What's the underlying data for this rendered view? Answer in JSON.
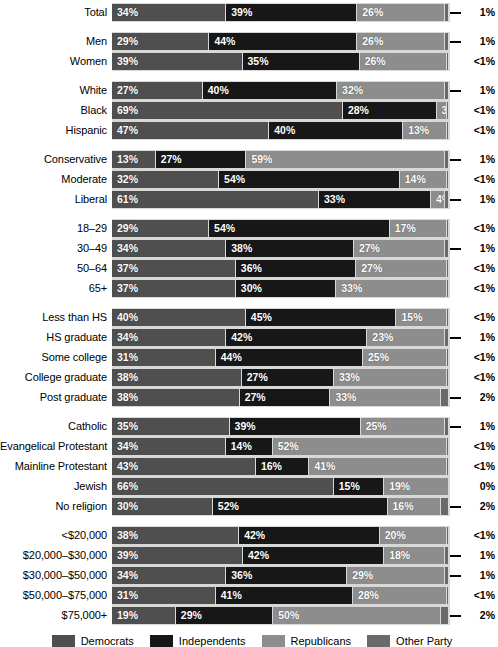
{
  "chart_data": {
    "type": "bar",
    "subtype": "stacked-horizontal-100pct",
    "title": "",
    "xlabel": "",
    "ylabel": "",
    "xlim": [
      0,
      100
    ],
    "grid": false,
    "legend_position": "bottom",
    "series": [
      {
        "name": "Democrats",
        "key": "dem",
        "color": "#4f4f4f"
      },
      {
        "name": "Independents",
        "key": "ind",
        "color": "#171717"
      },
      {
        "name": "Republicans",
        "key": "rep",
        "color": "#8d8d8d"
      },
      {
        "name": "Other Party",
        "key": "oth",
        "color": "#6a6a6a"
      }
    ],
    "groups": [
      {
        "name": "overall",
        "rows": [
          {
            "label": "Total",
            "dem": 34,
            "ind": 39,
            "rep": 26,
            "oth": 1,
            "dem_label": "34%",
            "ind_label": "39%",
            "rep_label": "26%",
            "oth_label": "1%",
            "leader": true
          }
        ]
      },
      {
        "name": "gender",
        "rows": [
          {
            "label": "Men",
            "dem": 29,
            "ind": 44,
            "rep": 26,
            "oth": 1,
            "dem_label": "29%",
            "ind_label": "44%",
            "rep_label": "26%",
            "oth_label": "1%",
            "leader": true
          },
          {
            "label": "Women",
            "dem": 39,
            "ind": 35,
            "rep": 26,
            "oth": 0.4,
            "dem_label": "39%",
            "ind_label": "35%",
            "rep_label": "26%",
            "oth_label": "<1%",
            "leader": false
          }
        ]
      },
      {
        "name": "race",
        "rows": [
          {
            "label": "White",
            "dem": 27,
            "ind": 40,
            "rep": 32,
            "oth": 1,
            "dem_label": "27%",
            "ind_label": "40%",
            "rep_label": "32%",
            "oth_label": "1%",
            "leader": true
          },
          {
            "label": "Black",
            "dem": 69,
            "ind": 28,
            "rep": 3,
            "oth": 0.4,
            "dem_label": "69%",
            "ind_label": "28%",
            "rep_label": "3%",
            "oth_label": "<1%",
            "leader": false
          },
          {
            "label": "Hispanic",
            "dem": 47,
            "ind": 40,
            "rep": 13,
            "oth": 0.4,
            "dem_label": "47%",
            "ind_label": "40%",
            "rep_label": "13%",
            "oth_label": "<1%",
            "leader": false
          }
        ]
      },
      {
        "name": "ideology",
        "rows": [
          {
            "label": "Conservative",
            "dem": 13,
            "ind": 27,
            "rep": 59,
            "oth": 1,
            "dem_label": "13%",
            "ind_label": "27%",
            "rep_label": "59%",
            "oth_label": "1%",
            "leader": true
          },
          {
            "label": "Moderate",
            "dem": 32,
            "ind": 54,
            "rep": 14,
            "oth": 0.4,
            "dem_label": "32%",
            "ind_label": "54%",
            "rep_label": "14%",
            "oth_label": "<1%",
            "leader": false
          },
          {
            "label": "Liberal",
            "dem": 61,
            "ind": 33,
            "rep": 4,
            "oth": 1,
            "dem_label": "61%",
            "ind_label": "33%",
            "rep_label": "4%",
            "oth_label": "1%",
            "leader": true
          }
        ]
      },
      {
        "name": "age",
        "rows": [
          {
            "label": "18–29",
            "dem": 29,
            "ind": 54,
            "rep": 17,
            "oth": 0.4,
            "dem_label": "29%",
            "ind_label": "54%",
            "rep_label": "17%",
            "oth_label": "<1%",
            "leader": false
          },
          {
            "label": "30–49",
            "dem": 34,
            "ind": 38,
            "rep": 27,
            "oth": 1,
            "dem_label": "34%",
            "ind_label": "38%",
            "rep_label": "27%",
            "oth_label": "1%",
            "leader": true
          },
          {
            "label": "50–64",
            "dem": 37,
            "ind": 36,
            "rep": 27,
            "oth": 0.4,
            "dem_label": "37%",
            "ind_label": "36%",
            "rep_label": "27%",
            "oth_label": "<1%",
            "leader": false
          },
          {
            "label": "65+",
            "dem": 37,
            "ind": 30,
            "rep": 33,
            "oth": 0.4,
            "dem_label": "37%",
            "ind_label": "30%",
            "rep_label": "33%",
            "oth_label": "<1%",
            "leader": false
          }
        ]
      },
      {
        "name": "education",
        "rows": [
          {
            "label": "Less than HS",
            "dem": 40,
            "ind": 45,
            "rep": 15,
            "oth": 0.4,
            "dem_label": "40%",
            "ind_label": "45%",
            "rep_label": "15%",
            "oth_label": "<1%",
            "leader": false
          },
          {
            "label": "HS graduate",
            "dem": 34,
            "ind": 42,
            "rep": 23,
            "oth": 1,
            "dem_label": "34%",
            "ind_label": "42%",
            "rep_label": "23%",
            "oth_label": "1%",
            "leader": true
          },
          {
            "label": "Some college",
            "dem": 31,
            "ind": 44,
            "rep": 25,
            "oth": 0.4,
            "dem_label": "31%",
            "ind_label": "44%",
            "rep_label": "25%",
            "oth_label": "<1%",
            "leader": false
          },
          {
            "label": "College graduate",
            "dem": 38,
            "ind": 27,
            "rep": 33,
            "oth": 0.4,
            "dem_label": "38%",
            "ind_label": "27%",
            "rep_label": "33%",
            "oth_label": "<1%",
            "leader": false
          },
          {
            "label": "Post graduate",
            "dem": 38,
            "ind": 27,
            "rep": 33,
            "oth": 2,
            "dem_label": "38%",
            "ind_label": "27%",
            "rep_label": "33%",
            "oth_label": "2%",
            "leader": true
          }
        ]
      },
      {
        "name": "religion",
        "rows": [
          {
            "label": "Catholic",
            "dem": 35,
            "ind": 39,
            "rep": 25,
            "oth": 1,
            "dem_label": "35%",
            "ind_label": "39%",
            "rep_label": "25%",
            "oth_label": "1%",
            "leader": true
          },
          {
            "label": "Evangelical Protestant",
            "dem": 34,
            "ind": 14,
            "rep": 52,
            "oth": 0.4,
            "dem_label": "34%",
            "ind_label": "14%",
            "rep_label": "52%",
            "oth_label": "<1%",
            "leader": false
          },
          {
            "label": "Mainline Protestant",
            "dem": 43,
            "ind": 16,
            "rep": 41,
            "oth": 0.4,
            "dem_label": "43%",
            "ind_label": "16%",
            "rep_label": "41%",
            "oth_label": "<1%",
            "leader": false
          },
          {
            "label": "Jewish",
            "dem": 66,
            "ind": 15,
            "rep": 19,
            "oth": 0,
            "dem_label": "66%",
            "ind_label": "15%",
            "rep_label": "19%",
            "oth_label": "0%",
            "leader": false
          },
          {
            "label": "No religion",
            "dem": 30,
            "ind": 52,
            "rep": 16,
            "oth": 2,
            "dem_label": "30%",
            "ind_label": "52%",
            "rep_label": "16%",
            "oth_label": "2%",
            "leader": true
          }
        ]
      },
      {
        "name": "income",
        "rows": [
          {
            "label": "<$20,000",
            "dem": 38,
            "ind": 42,
            "rep": 20,
            "oth": 0.4,
            "dem_label": "38%",
            "ind_label": "42%",
            "rep_label": "20%",
            "oth_label": "<1%",
            "leader": false
          },
          {
            "label": "$20,000–$30,000",
            "dem": 39,
            "ind": 42,
            "rep": 18,
            "oth": 1,
            "dem_label": "39%",
            "ind_label": "42%",
            "rep_label": "18%",
            "oth_label": "1%",
            "leader": true
          },
          {
            "label": "$30,000–$50,000",
            "dem": 34,
            "ind": 36,
            "rep": 29,
            "oth": 1,
            "dem_label": "34%",
            "ind_label": "36%",
            "rep_label": "29%",
            "oth_label": "1%",
            "leader": true
          },
          {
            "label": "$50,000–$75,000",
            "dem": 31,
            "ind": 41,
            "rep": 28,
            "oth": 0.4,
            "dem_label": "31%",
            "ind_label": "41%",
            "rep_label": "28%",
            "oth_label": "<1%",
            "leader": false
          },
          {
            "label": "$75,000+",
            "dem": 19,
            "ind": 29,
            "rep": 50,
            "oth": 2,
            "dem_label": "19%",
            "ind_label": "29%",
            "rep_label": "50%",
            "oth_label": "2%",
            "leader": true
          }
        ]
      }
    ],
    "legend": [
      {
        "label": "Democrats",
        "color": "#4f4f4f"
      },
      {
        "label": "Independents",
        "color": "#171717"
      },
      {
        "label": "Republicans",
        "color": "#8d8d8d"
      },
      {
        "label": "Other Party",
        "color": "#6a6a6a"
      }
    ]
  }
}
